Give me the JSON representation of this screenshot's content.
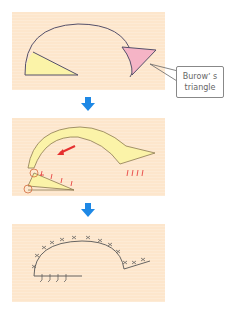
{
  "diagram": {
    "steps": [
      {
        "id": "step-1",
        "description": "Semicircular defect with yellow triangle and pink Burow's triangle excised"
      },
      {
        "id": "step-2",
        "description": "Flap advanced (red arrow) with tension arrows along base"
      },
      {
        "id": "step-3",
        "description": "Closed wound with sutures"
      }
    ],
    "callout": {
      "line1": "Burowʼ s",
      "line2": "triangle"
    },
    "colors": {
      "panel_bg": "#fde6cc",
      "yellow_fill": "#fbf3a8",
      "pink_fill": "#f5b4c6",
      "outline": "#55506a",
      "flow_arrow": "#1e88e5",
      "red_arrow": "#e53030",
      "suture": "#555555"
    },
    "flow_arrows": [
      "down-arrow",
      "down-arrow"
    ]
  }
}
